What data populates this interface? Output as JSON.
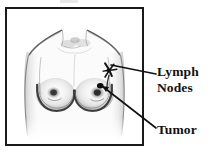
{
  "figure": {
    "type": "medical-illustration",
    "frame": {
      "border_color": "#1a1a1a",
      "background": "#ffffff"
    }
  },
  "annotations": [
    {
      "id": "lymph-nodes",
      "label_line_1": "Lymph",
      "label_line_2": "Nodes",
      "full_label": "Lymph Nodes",
      "points_to": "left-armpit-region",
      "marker": "dark-cross-cluster"
    },
    {
      "id": "tumor",
      "label_line_1": "Tumor",
      "full_label": "Tumor",
      "points_to": "left-breast-upper-quadrant",
      "marker": "dark-spot"
    }
  ],
  "colors": {
    "ink": "#111111",
    "frame": "#1a1a1a",
    "sketch_light": "#b9b9b9",
    "sketch_mid": "#8a8a8a",
    "sketch_dark": "#2b2b2b",
    "background": "#ffffff"
  }
}
